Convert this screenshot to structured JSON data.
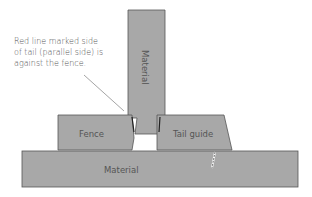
{
  "diagram": {
    "annotation": {
      "lines": [
        "Red line marked side",
        "of tail (parallel side) is",
        "against the fence."
      ]
    },
    "labels": {
      "top_material": "Material",
      "fence": "Fence",
      "tail_guide": "Tail guide",
      "bottom_material": "Material"
    },
    "colors": {
      "fill": "#a8a8a8",
      "stroke": "#444444",
      "background": "#ffffff"
    }
  }
}
